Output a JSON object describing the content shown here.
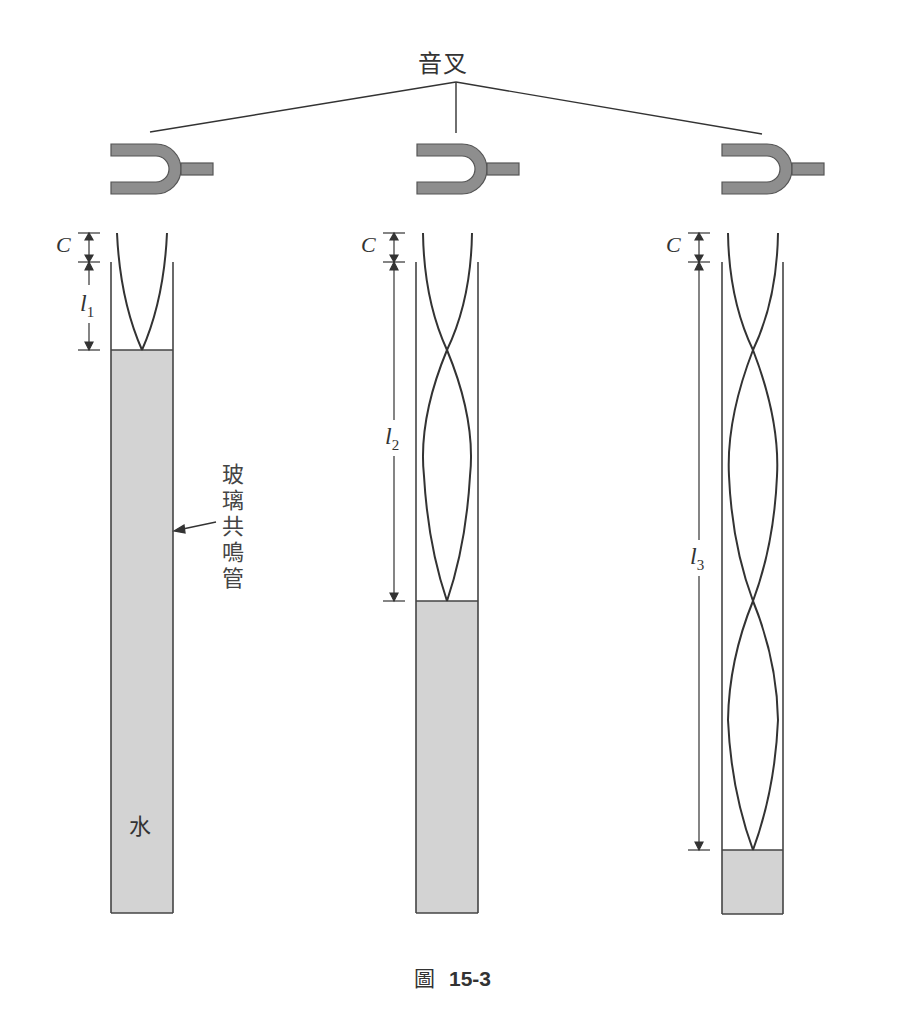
{
  "figure": {
    "caption_prefix": "圖",
    "caption_number": "15-3",
    "title": "音叉",
    "tube_label_lines": [
      "玻",
      "璃",
      "共",
      "鳴",
      "管"
    ],
    "water_label": "水"
  },
  "colors": {
    "fork_fill": "#8e8e8e",
    "fork_stroke": "#555555",
    "water_fill": "#d3d3d3",
    "line": "#333333",
    "background": "#ffffff"
  },
  "tubes": [
    {
      "id": 1,
      "end_correction_label": "C",
      "length_label": "l",
      "length_sub": "1",
      "half_wavelengths": 1,
      "resonance": "first"
    },
    {
      "id": 2,
      "end_correction_label": "C",
      "length_label": "l",
      "length_sub": "2",
      "half_wavelengths": 3,
      "resonance": "second"
    },
    {
      "id": 3,
      "end_correction_label": "C",
      "length_label": "l",
      "length_sub": "3",
      "half_wavelengths": 5,
      "resonance": "third"
    }
  ]
}
